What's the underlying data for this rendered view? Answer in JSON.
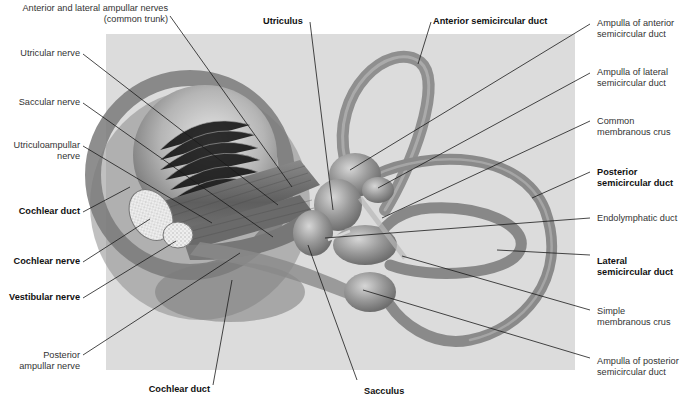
{
  "figure": {
    "panel_color": "#dcdcdc",
    "tissue_color": "#8f8f8f",
    "line_color": "#1a1a1a"
  },
  "labels": {
    "anterior_lateral_ampullar": {
      "line1": "Anterior and lateral ampullar nerves",
      "line2": "(common trunk)"
    },
    "utricular_nerve": {
      "line1": "Utricular nerve"
    },
    "saccular_nerve": {
      "line1": "Saccular nerve"
    },
    "utriculoampullar_nerve": {
      "line1": "Utriculoampullar",
      "line2": "nerve"
    },
    "cochlear_duct_left": {
      "line1": "Cochlear duct"
    },
    "cochlear_nerve": {
      "line1": "Cochlear nerve"
    },
    "vestibular_nerve": {
      "line1": "Vestibular nerve"
    },
    "posterior_ampullar_nerve": {
      "line1": "Posterior",
      "line2": "ampullar nerve"
    },
    "cochlear_duct_bottom": {
      "line1": "Cochlear duct"
    },
    "utriculus": {
      "line1": "Utriculus"
    },
    "anterior_semicircular_duct": {
      "line1": "Anterior semicircular duct"
    },
    "ampulla_anterior": {
      "line1": "Ampulla of anterior",
      "line2": "semicircular duct"
    },
    "ampulla_lateral": {
      "line1": "Ampulla of lateral",
      "line2": "semicircular duct"
    },
    "common_membranous_crus": {
      "line1": "Common",
      "line2": "membranous crus"
    },
    "posterior_semicircular_duct": {
      "line1": "Posterior",
      "line2": "semicircular duct"
    },
    "endolymphatic_duct": {
      "line1": "Endolymphatic duct"
    },
    "lateral_semicircular_duct": {
      "line1": "Lateral",
      "line2": "semicircular duct"
    },
    "simple_membranous_crus": {
      "line1": "Simple",
      "line2": "membranous crus"
    },
    "ampulla_posterior": {
      "line1": "Ampulla of posterior",
      "line2": "semicircular duct"
    },
    "sacculus": {
      "line1": "Sacculus"
    }
  }
}
